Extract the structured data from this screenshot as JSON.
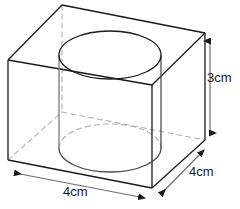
{
  "figure": {
    "colors": {
      "stroke_solid": "#1a1a1a",
      "stroke_hidden": "#b0b0b0",
      "stroke_cylinder": "#3a3a3a",
      "background": "#ffffff",
      "text": "#1a1a1a"
    },
    "dimensions": [
      {
        "id": "height",
        "value": "3cm",
        "axis": "vertical",
        "position": "right",
        "arrow": "double-headed"
      },
      {
        "id": "width",
        "value": "4cm",
        "axis": "horizontal",
        "position": "bottom",
        "arrow": "double-headed"
      },
      {
        "id": "depth",
        "value": "4cm",
        "axis": "diagonal",
        "position": "bottom-right",
        "arrow": "double-headed"
      }
    ],
    "geometry": {
      "box": {
        "top_back": [
          62,
          5
        ],
        "top_left": [
          8,
          60
        ],
        "top_right": [
          205,
          33
        ],
        "top_front": [
          152,
          85
        ],
        "bottom_left": [
          8,
          160
        ],
        "bottom_front": [
          152,
          188
        ],
        "bottom_right": [
          205,
          140
        ]
      },
      "cylinder": {
        "top_center": [
          110,
          55
        ],
        "bottom_center": [
          110,
          148
        ],
        "radius_x": 51,
        "radius_y": 24
      }
    }
  }
}
